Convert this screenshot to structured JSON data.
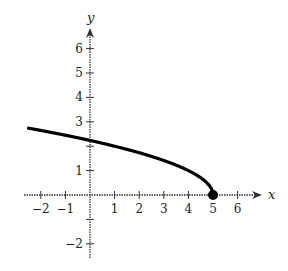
{
  "chart_data": {
    "type": "line",
    "title": "",
    "xlabel": "x",
    "ylabel": "y",
    "xlim": [
      -2.5,
      7
    ],
    "ylim": [
      -2.5,
      7
    ],
    "x_ticks": [
      -2,
      -1,
      1,
      2,
      3,
      4,
      5,
      6
    ],
    "y_ticks": [
      -2,
      1,
      2,
      3,
      4,
      5,
      6
    ],
    "x_tick_labels": [
      "−2",
      "−1",
      "1",
      "2",
      "3",
      "4",
      "5",
      "6"
    ],
    "y_tick_labels": [
      "−2",
      "1",
      "2",
      "3",
      "4",
      "5",
      "6"
    ],
    "grid": false,
    "legend": null,
    "series": [
      {
        "name": "y = sqrt(5 - x)",
        "x": [
          -2.5,
          -2,
          -1,
          0,
          1,
          2,
          3,
          4,
          4.5,
          4.8,
          5
        ],
        "y": [
          2.74,
          2.65,
          2.45,
          2.24,
          2.0,
          1.73,
          1.41,
          1.0,
          0.71,
          0.45,
          0
        ],
        "color": "#000000",
        "endpoint": {
          "x": 5,
          "y": 0,
          "marker": "filled-circle"
        }
      }
    ]
  },
  "colors": {
    "curve": "#000000",
    "axis": "#333333"
  }
}
